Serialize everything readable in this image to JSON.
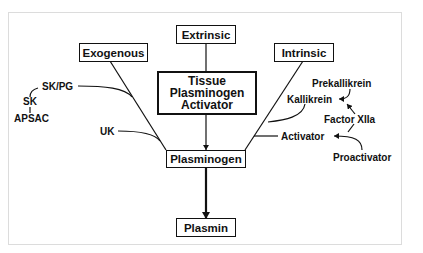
{
  "diagram": {
    "boxes": {
      "extrinsic": "Extrinsic",
      "exogenous": "Exogenous",
      "intrinsic": "Intrinsic",
      "tpa_line1": "Tissue",
      "tpa_line2": "Plasminogen",
      "tpa_line3": "Activator",
      "plasminogen": "Plasminogen",
      "plasmin": "Plasmin"
    },
    "exogenous_agents": {
      "skpg": "SK/PG",
      "sk": "SK",
      "apsac": "APSAC",
      "uk": "UK"
    },
    "intrinsic_agents": {
      "prekallikrein": "Prekallikrein",
      "kallikrein": "Kallikrein",
      "factor_xiia": "Factor XIIa",
      "activator": "Activator",
      "proactivator": "Proactivator"
    },
    "colors": {
      "ink": "#111111",
      "frame": "#dcdcdc",
      "background": "#ffffff"
    }
  }
}
